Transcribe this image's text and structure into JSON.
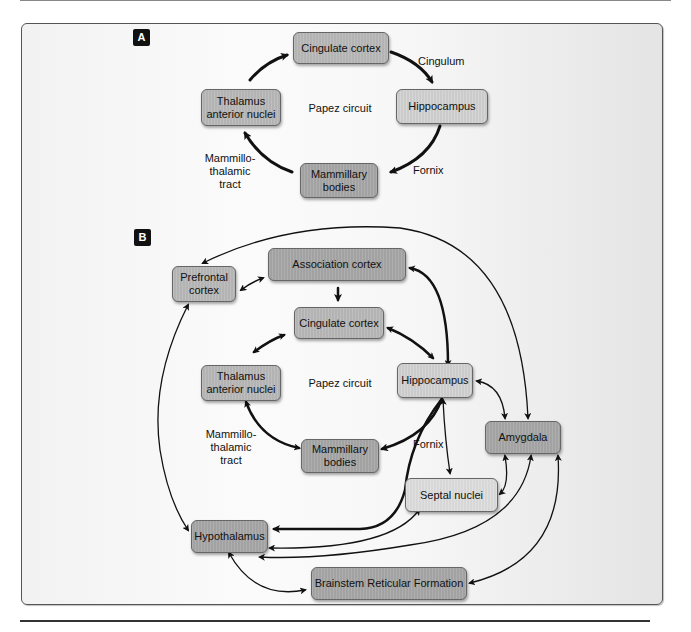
{
  "panel_a": {
    "badge": "A",
    "center_label": "Papez circuit",
    "nodes": {
      "cingulate": "Cingulate cortex",
      "hippocampus": "Hippocampus",
      "mammillary_line1": "Mammillary",
      "mammillary_line2": "bodies",
      "thalamus_line1": "Thalamus",
      "thalamus_line2": "anterior nuclei"
    },
    "edge_labels": {
      "cingulum": "Cingulum",
      "fornix": "Fornix",
      "mtt_line1": "Mammillo-",
      "mtt_line2": "thalamic",
      "mtt_line3": "tract"
    }
  },
  "panel_b": {
    "badge": "B",
    "center_label": "Papez circuit",
    "nodes": {
      "prefrontal_line1": "Prefrontal",
      "prefrontal_line2": "cortex",
      "association": "Association cortex",
      "cingulate": "Cingulate cortex",
      "thalamus_line1": "Thalamus",
      "thalamus_line2": "anterior nuclei",
      "hippocampus": "Hippocampus",
      "mammillary_line1": "Mammillary",
      "mammillary_line2": "bodies",
      "amygdala": "Amygdala",
      "septal": "Septal nuclei",
      "hypothalamus": "Hypothalamus",
      "brainstem": "Brainstem Reticular Formation"
    },
    "edge_labels": {
      "fornix": "Fornix",
      "mtt_line1": "Mammillo-",
      "mtt_line2": "thalamic",
      "mtt_line3": "tract"
    }
  },
  "colors": {
    "frame_border": "#555555",
    "node_mid": "#b9b9b9",
    "node_dark": "#a7a7a7",
    "node_light": "#d2d2d2",
    "arrow": "#111111",
    "badge": "#111111"
  }
}
